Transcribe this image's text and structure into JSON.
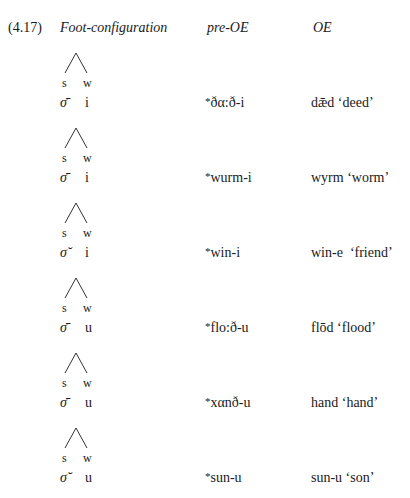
{
  "example": {
    "number": "(4.17)",
    "headers": {
      "foot": "Foot-configuration",
      "pre_oe": "pre-OE",
      "oe": "OE"
    },
    "tree_labels": {
      "strong": "s",
      "weak": "w"
    },
    "rows": [
      {
        "syllable": "σ̄",
        "ending": "i",
        "star": "*",
        "pre_oe": "ðα:ð-i",
        "oe": "dǣd ‘deed’"
      },
      {
        "syllable": "σ̄",
        "ending": "i",
        "star": "*",
        "pre_oe": "wurm-i",
        "oe": "wyrm ‘worm’"
      },
      {
        "syllable": "σ̆",
        "ending": "i",
        "star": "*",
        "pre_oe": "win-i",
        "oe": "win-e  ‘friend’"
      },
      {
        "syllable": "σ̄",
        "ending": "u",
        "star": "*",
        "pre_oe": "flo:ð-u",
        "oe": "flōd ‘flood’"
      },
      {
        "syllable": "σ̄",
        "ending": "u",
        "star": "*",
        "pre_oe": "xαnð-u",
        "oe": "hand ‘hand’"
      },
      {
        "syllable": "σ̆",
        "ending": "u",
        "star": "*",
        "pre_oe": "sun-u",
        "oe": "sun-u ‘son’"
      }
    ]
  }
}
